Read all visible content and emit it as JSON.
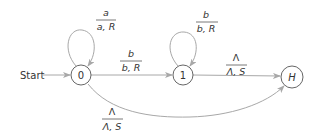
{
  "diagram": {
    "type": "turing-machine-state-diagram",
    "start_label": "Start",
    "colors": {
      "edge": "#a8a8a8",
      "node_stroke": "#555555",
      "text": "#333333"
    },
    "states": [
      {
        "id": "q0",
        "label": "0"
      },
      {
        "id": "q1",
        "label": "1"
      },
      {
        "id": "halt",
        "label": "H"
      }
    ],
    "transitions": [
      {
        "from": "0",
        "to": "0",
        "read": "a",
        "write_move": "a, R"
      },
      {
        "from": "0",
        "to": "1",
        "read": "b",
        "write_move": "b, R"
      },
      {
        "from": "1",
        "to": "1",
        "read": "b",
        "write_move": "b, R"
      },
      {
        "from": "1",
        "to": "H",
        "read": "Λ",
        "write_move": "Λ, S"
      },
      {
        "from": "0",
        "to": "H",
        "read": "Λ",
        "write_move": "Λ, S"
      }
    ]
  }
}
